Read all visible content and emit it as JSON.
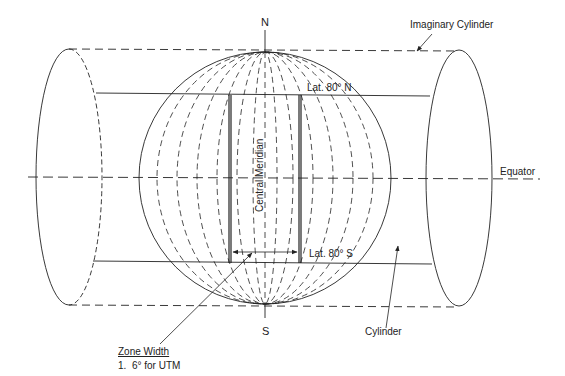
{
  "diagram": {
    "labels": {
      "north": "N",
      "south": "S",
      "imaginary_cylinder": "Imaginary Cylinder",
      "lat_north": "Lat. 80° N",
      "lat_south": "Lat. 80° S",
      "central_meridian": "Central Meridian",
      "equator": "Equator",
      "cylinder": "Cylinder",
      "zone_width_title": "Zone Width",
      "zone_width_item": "1.  6° for UTM"
    },
    "colors": {
      "stroke": "#222222",
      "background": "#ffffff"
    }
  }
}
